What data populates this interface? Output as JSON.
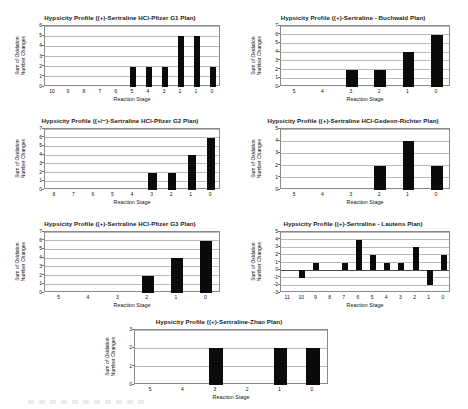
{
  "figure": {
    "axis_x_title": "Reaction Stage",
    "axis_y_title": "Sum of Oxidation\nNumber Changes"
  },
  "chart_data": [
    {
      "id": "pfizer-g1",
      "type": "bar",
      "title": "Hypsicity Profile ((+)-Sertraline HCl-Pfizer G1 Plan)",
      "xlabel": "Reaction Stage",
      "ylabel": "Sum of Oxidation Number Changes",
      "categories": [
        "10",
        "9",
        "8",
        "7",
        "6",
        "5",
        "4",
        "3",
        "2",
        "1",
        "0"
      ],
      "values": [
        0,
        0,
        0,
        0,
        0,
        2,
        2,
        2,
        5,
        5,
        2
      ],
      "yticks": [
        0,
        1,
        2,
        3,
        4,
        5,
        6
      ],
      "ylim": [
        0,
        6
      ],
      "grid": true
    },
    {
      "id": "buchwald",
      "type": "bar",
      "title": "Hypsicity Profile ((+)-Sertraline - Buchwald Plan)",
      "xlabel": "Reaction Stage",
      "ylabel": "Sum of Oxidation Number Changes",
      "categories": [
        "5",
        "4",
        "3",
        "2",
        "1",
        "0"
      ],
      "values": [
        0,
        0,
        2,
        2,
        4,
        6
      ],
      "yticks": [
        0,
        1,
        2,
        3,
        4,
        5,
        6,
        7
      ],
      "ylim": [
        0,
        7
      ],
      "grid": true
    },
    {
      "id": "pfizer-g2",
      "type": "bar",
      "title": "Hypsicity Profile ((+/−)-Sertraline HCl-Pfizer G2 Plan)",
      "xlabel": "Reaction Stage",
      "ylabel": "Sum of Oxidation Number Changes",
      "categories": [
        "8",
        "7",
        "6",
        "5",
        "4",
        "3",
        "2",
        "1",
        "0"
      ],
      "values": [
        0,
        0,
        0,
        0,
        0,
        2,
        2,
        4,
        6
      ],
      "yticks": [
        0,
        1,
        2,
        3,
        4,
        5,
        6,
        7
      ],
      "ylim": [
        0,
        7
      ],
      "grid": true
    },
    {
      "id": "gedeon-richter",
      "type": "bar",
      "title": "Hypsicity Profile ((+)-Sertraline HCl-Gedeon-Richter Plan)",
      "xlabel": "Reaction Stage",
      "ylabel": "Sum of Oxidation Number Changes",
      "categories": [
        "5",
        "4",
        "3",
        "2",
        "1",
        "0"
      ],
      "values": [
        0,
        0,
        0,
        2,
        4,
        2
      ],
      "yticks": [
        0,
        1,
        2,
        3,
        4,
        5
      ],
      "ylim": [
        0,
        5
      ],
      "grid": true
    },
    {
      "id": "pfizer-g3",
      "type": "bar",
      "title": "Hypsicity Profile ((+)-Sertraline HCl-Pfizer G3 Plan)",
      "xlabel": "Reaction Stage",
      "ylabel": "Sum of Oxidation Number Changes",
      "categories": [
        "5",
        "4",
        "3",
        "2",
        "1",
        "0"
      ],
      "values": [
        0,
        0,
        0,
        2,
        4,
        6
      ],
      "yticks": [
        0,
        1,
        2,
        3,
        4,
        5,
        6,
        7
      ],
      "ylim": [
        0,
        7
      ],
      "grid": true
    },
    {
      "id": "lautens",
      "type": "bar",
      "title": "Hypsicity Profile ((+)-Sertraline - Lautens Plan)",
      "xlabel": "Reaction Stage",
      "ylabel": "Sum of Oxidation Number Changes",
      "categories": [
        "11",
        "10",
        "9",
        "8",
        "7",
        "6",
        "5",
        "4",
        "3",
        "2",
        "1",
        "0"
      ],
      "values": [
        0,
        -1,
        1,
        0,
        1,
        4,
        2,
        1,
        1,
        3,
        -2,
        2
      ],
      "yticks": [
        -3,
        -2,
        -1,
        0,
        1,
        2,
        3,
        4,
        5
      ],
      "ylim": [
        -3,
        5
      ],
      "grid": true
    },
    {
      "id": "zhao",
      "type": "bar",
      "title": "Hypsicity Profile ((+)-Sertraline-Zhao Plan)",
      "xlabel": "Reaction Stage",
      "ylabel": "Sum of Oxidation Number Changes",
      "categories": [
        "5",
        "4",
        "3",
        "2",
        "1",
        "0"
      ],
      "values": [
        0,
        0,
        2,
        0,
        2,
        2
      ],
      "yticks": [
        0,
        1,
        2,
        3
      ],
      "ylim": [
        0,
        3
      ],
      "grid": true
    }
  ]
}
